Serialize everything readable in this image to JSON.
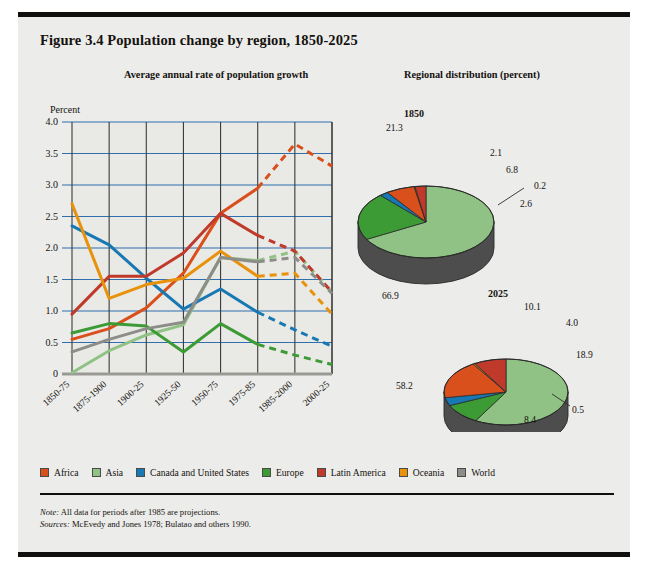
{
  "figure": {
    "title": "Figure 3.4  Population change by region, 1850-2025",
    "left_panel_heading": "Average annual rate of population growth",
    "right_panel_heading": "Regional distribution (percent)",
    "note_label": "Note:",
    "note_text": "All data for periods after 1985 are projections.",
    "sources_label": "Sources:",
    "sources_text": "McEvedy and Jones 1978; Bulatao and others 1990."
  },
  "legend": {
    "items": [
      {
        "label": "Africa",
        "color": "#d9501c"
      },
      {
        "label": "Asia",
        "color": "#8fc284"
      },
      {
        "label": "Canada and United States",
        "color": "#1878b4"
      },
      {
        "label": "Europe",
        "color": "#3d9b35"
      },
      {
        "label": "Latin America",
        "color": "#c03a2b"
      },
      {
        "label": "Oceania",
        "color": "#e8920c"
      },
      {
        "label": "World",
        "color": "#8c8c88"
      }
    ]
  },
  "chart_data": [
    {
      "type": "line",
      "title": "Average annual rate of population growth",
      "xlabel": "",
      "ylabel": "Percent",
      "ylim": [
        0,
        4.0
      ],
      "yticks": [
        "0",
        "0.5",
        "1.0",
        "1.5",
        "2.0",
        "2.5",
        "3.0",
        "3.5",
        "4.0"
      ],
      "ytick_values": [
        0,
        0.5,
        1.0,
        1.5,
        2.0,
        2.5,
        3.0,
        3.5,
        4.0
      ],
      "grid": true,
      "legend_position": "bottom",
      "projection_note": "values from period 1985-2000 onward are dashed projections",
      "categories": [
        "1850-75",
        "1875-1900",
        "1900-25",
        "1925-50",
        "1950-75",
        "1975-85",
        "1985-2000",
        "2000-25"
      ],
      "solid_through_index": 5,
      "series": [
        {
          "name": "Africa",
          "color": "#d9501c",
          "values": [
            0.55,
            0.72,
            1.05,
            1.6,
            2.55,
            2.95,
            3.65,
            3.3
          ]
        },
        {
          "name": "Asia",
          "color": "#8fc284",
          "values": [
            0.02,
            0.37,
            0.62,
            0.78,
            1.85,
            1.8,
            1.95,
            1.3
          ]
        },
        {
          "name": "Canada and United States",
          "color": "#1878b4",
          "values": [
            2.35,
            2.05,
            1.52,
            1.03,
            1.35,
            0.98,
            0.7,
            0.44
          ]
        },
        {
          "name": "Europe",
          "color": "#3d9b35",
          "values": [
            0.65,
            0.8,
            0.76,
            0.35,
            0.8,
            0.47,
            0.3,
            0.15
          ]
        },
        {
          "name": "Latin America",
          "color": "#c03a2b",
          "values": [
            0.95,
            1.55,
            1.55,
            1.92,
            2.55,
            2.2,
            1.95,
            1.3
          ]
        },
        {
          "name": "Oceania",
          "color": "#e8920c",
          "values": [
            2.7,
            1.2,
            1.42,
            1.52,
            1.95,
            1.55,
            1.6,
            0.95
          ]
        },
        {
          "name": "World",
          "color": "#8c8c88",
          "values": [
            0.35,
            0.55,
            0.72,
            0.82,
            1.85,
            1.78,
            1.85,
            1.28
          ]
        }
      ]
    },
    {
      "type": "pie",
      "title": "1850",
      "unit": "percent",
      "labels": [
        "Asia",
        "Europe",
        "Canada and United States",
        "Africa",
        "Oceania",
        "Latin America"
      ],
      "values": [
        66.9,
        21.3,
        2.1,
        6.8,
        0.2,
        2.6
      ],
      "colors": [
        "#8fc284",
        "#3d9b35",
        "#1878b4",
        "#d9501c",
        "#e8920c",
        "#c03a2b"
      ],
      "value_labels": [
        "66.9",
        "21.3",
        "2.1",
        "6.8",
        "0.2",
        "2.6"
      ]
    },
    {
      "type": "pie",
      "title": "2025",
      "unit": "percent",
      "labels": [
        "Asia",
        "Europe",
        "Canada and United States",
        "Africa",
        "Oceania",
        "Latin America"
      ],
      "values": [
        58.2,
        10.1,
        4.0,
        18.9,
        0.5,
        8.4
      ],
      "colors": [
        "#8fc284",
        "#3d9b35",
        "#1878b4",
        "#d9501c",
        "#e8920c",
        "#c03a2b"
      ],
      "value_labels": [
        "58.2",
        "10.1",
        "4.0",
        "18.9",
        "0.5",
        "8.4"
      ]
    }
  ]
}
